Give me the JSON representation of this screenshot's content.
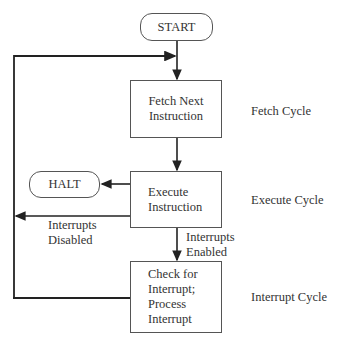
{
  "diagram": {
    "nodes": {
      "start": {
        "label": "START",
        "shape": "rounded-terminal"
      },
      "fetch": {
        "label": "Fetch Next\nInstruction",
        "shape": "process"
      },
      "execute": {
        "label": "Execute\nInstruction",
        "shape": "process"
      },
      "halt": {
        "label": "HALT",
        "shape": "rounded-terminal"
      },
      "interrupt": {
        "label": "Check for\nInterrupt;\nProcess\nInterrupt",
        "shape": "process"
      }
    },
    "stage_labels": {
      "fetch": "Fetch Cycle",
      "execute": "Execute Cycle",
      "interrupt": "Interrupt Cycle"
    },
    "edge_labels": {
      "disabled": "Interrupts\nDisabled",
      "enabled": "Interrupts\nEnabled"
    },
    "edges": [
      {
        "from": "start",
        "to": "fetch"
      },
      {
        "from": "fetch",
        "to": "execute"
      },
      {
        "from": "execute",
        "to": "halt"
      },
      {
        "from": "execute",
        "to": "fetch",
        "label": "Interrupts Disabled"
      },
      {
        "from": "execute",
        "to": "interrupt",
        "label": "Interrupts Enabled"
      },
      {
        "from": "interrupt",
        "to": "fetch"
      }
    ],
    "colors": {
      "line": "#333333",
      "border": "#555555",
      "text": "#333333"
    }
  }
}
